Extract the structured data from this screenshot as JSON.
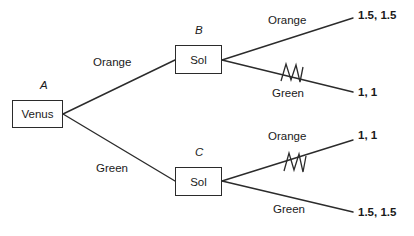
{
  "diagram": {
    "type": "game-tree",
    "title": "",
    "nodes": [
      {
        "id": "A",
        "name_label": "A",
        "box_label": "Venus",
        "player": "Venus",
        "x": 12,
        "y": 100,
        "w": 51,
        "h": 28
      },
      {
        "id": "B",
        "name_label": "B",
        "box_label": "Sol",
        "player": "Sol",
        "x": 175,
        "y": 45,
        "w": 47,
        "h": 29
      },
      {
        "id": "C",
        "name_label": "C",
        "box_label": "Sol",
        "player": "Sol",
        "x": 175,
        "y": 167,
        "w": 47,
        "h": 29
      }
    ],
    "branches": [
      {
        "id": "a-orange",
        "from": "A",
        "to": "B",
        "label": "Orange",
        "pruned": false
      },
      {
        "id": "a-green",
        "from": "A",
        "to": "C",
        "label": "Green",
        "pruned": false
      },
      {
        "id": "b-orange",
        "from": "B",
        "to": "payoff-1",
        "label": "Orange",
        "pruned": false
      },
      {
        "id": "b-green",
        "from": "B",
        "to": "payoff-2",
        "label": "Green",
        "pruned": true
      },
      {
        "id": "c-orange",
        "from": "C",
        "to": "payoff-3",
        "label": "Orange",
        "pruned": true
      },
      {
        "id": "c-green",
        "from": "C",
        "to": "payoff-4",
        "label": "Green",
        "pruned": false
      }
    ],
    "payoffs": [
      {
        "id": "payoff-1",
        "text": "1.5, 1.5",
        "venus": 1.5,
        "sol": 1.5
      },
      {
        "id": "payoff-2",
        "text": "1, 1",
        "venus": 1,
        "sol": 1
      },
      {
        "id": "payoff-3",
        "text": "1, 1",
        "venus": 1,
        "sol": 1
      },
      {
        "id": "payoff-4",
        "text": "1.5, 1.5",
        "venus": 1.5,
        "sol": 1.5
      }
    ],
    "prune_marks": [
      {
        "id": "prune-b-green",
        "on_branch": "b-green",
        "symbol": "zigzag-strike"
      },
      {
        "id": "prune-c-orange",
        "on_branch": "c-orange",
        "symbol": "zigzag-strike"
      }
    ],
    "colors": {
      "line": "#2b2b2b",
      "text": "#1a1a1a",
      "background": "#ffffff"
    }
  }
}
